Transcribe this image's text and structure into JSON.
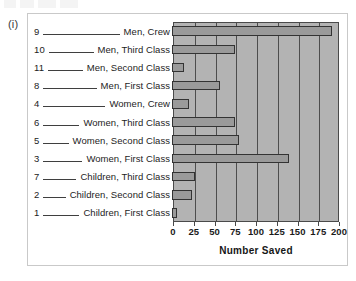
{
  "figure": {
    "label": "(i)",
    "panel_border_color": "#c9c9c9",
    "plot_background_color": "#b3b3b3",
    "bar_fill_color": "#9a9a9a",
    "bar_border_color": "#333333",
    "gridline_color": "#4d4d4d"
  },
  "chart_data": {
    "type": "bar",
    "orientation": "horizontal",
    "title": "",
    "xlabel": "Number Saved",
    "ylabel": "",
    "xlim": [
      0,
      200
    ],
    "xticks": [
      0,
      25,
      50,
      75,
      100,
      125,
      150,
      175,
      200
    ],
    "grid": true,
    "legend": "none",
    "categories": [
      "Men, Crew",
      "Men, Third Class",
      "Men, Second Class",
      "Men, First Class",
      "Women, Crew",
      "Women, Third Class",
      "Women, Second Class",
      "Women, First Class",
      "Children, Third Class",
      "Children, Second Class",
      "Children, First Class"
    ],
    "rank_numbers": [
      9,
      10,
      11,
      8,
      4,
      6,
      5,
      3,
      7,
      2,
      1
    ],
    "values": [
      192,
      75,
      14,
      57,
      20,
      76,
      80,
      140,
      27,
      24,
      6
    ],
    "rows": [
      {
        "num": "9",
        "category": "Men, Crew",
        "value": 192
      },
      {
        "num": "10",
        "category": "Men, Third Class",
        "value": 75
      },
      {
        "num": "11",
        "category": "Men, Second Class",
        "value": 14
      },
      {
        "num": "8",
        "category": "Men, First Class",
        "value": 57
      },
      {
        "num": "4",
        "category": "Women, Crew",
        "value": 20
      },
      {
        "num": "6",
        "category": "Women, Third Class",
        "value": 76
      },
      {
        "num": "5",
        "category": "Women, Second Class",
        "value": 80
      },
      {
        "num": "3",
        "category": "Women, First Class",
        "value": 140
      },
      {
        "num": "7",
        "category": "Children, Third Class",
        "value": 27
      },
      {
        "num": "2",
        "category": "Children, Second Class",
        "value": 24
      },
      {
        "num": "1",
        "category": "Children, First Class",
        "value": 6
      }
    ]
  }
}
